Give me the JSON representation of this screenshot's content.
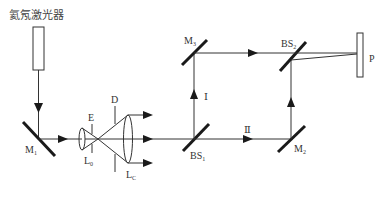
{
  "title": "氦氖激光器",
  "colors": {
    "line": "#333333",
    "mirror": "#1a1a1a",
    "background": "#ffffff"
  },
  "components": {
    "laser": {
      "label": "氦氖激光器"
    },
    "M1": {
      "base": "M",
      "sub": "1"
    },
    "L0": {
      "base": "L",
      "sub": "0"
    },
    "E": {
      "base": "E",
      "sub": ""
    },
    "D": {
      "base": "D",
      "sub": ""
    },
    "LC": {
      "base": "L",
      "sub": "C"
    },
    "BS1": {
      "base": "BS",
      "sub": "1"
    },
    "M3": {
      "base": "M",
      "sub": "3"
    },
    "BS2": {
      "base": "BS",
      "sub": "2"
    },
    "M2": {
      "base": "M",
      "sub": "2"
    },
    "P": {
      "base": "P",
      "sub": ""
    }
  },
  "paths": {
    "I": "Ⅰ",
    "II": "Ⅱ"
  }
}
